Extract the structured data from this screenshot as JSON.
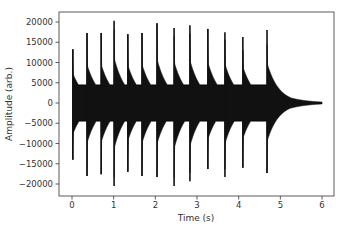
{
  "chart_data": {
    "type": "line",
    "title": "",
    "xlabel": "Time (s)",
    "ylabel": "Amplitude (arb.)",
    "xlim": [
      -0.32,
      6.3
    ],
    "ylim": [
      -22500,
      22500
    ],
    "grid": false,
    "legend": null,
    "x_ticks": [
      0,
      1,
      2,
      3,
      4,
      5,
      6
    ],
    "x_tick_labels": [
      "0",
      "1",
      "2",
      "3",
      "4",
      "5",
      "6"
    ],
    "y_ticks": [
      20000,
      15000,
      10000,
      5000,
      0,
      -5000,
      -10000,
      -15000,
      -20000
    ],
    "y_tick_labels": [
      "20000",
      "15000",
      "10000",
      "5000",
      "0",
      "−5000",
      "−10000",
      "−15000",
      "−20000"
    ],
    "line_color": "#111111",
    "strikes": [
      {
        "t": 0.02,
        "peak_pos": 13300,
        "peak_neg": -14000
      },
      {
        "t": 0.36,
        "peak_pos": 17300,
        "peak_neg": -18000
      },
      {
        "t": 0.7,
        "peak_pos": 17300,
        "peak_neg": -17600
      },
      {
        "t": 1.01,
        "peak_pos": 20300,
        "peak_neg": -20500
      },
      {
        "t": 1.34,
        "peak_pos": 17000,
        "peak_neg": -17000
      },
      {
        "t": 1.68,
        "peak_pos": 17300,
        "peak_neg": -18000
      },
      {
        "t": 2.04,
        "peak_pos": 19700,
        "peak_neg": -18300
      },
      {
        "t": 2.45,
        "peak_pos": 18500,
        "peak_neg": -20500
      },
      {
        "t": 2.83,
        "peak_pos": 19200,
        "peak_neg": -19300
      },
      {
        "t": 3.26,
        "peak_pos": 18300,
        "peak_neg": -16300
      },
      {
        "t": 3.67,
        "peak_pos": 17500,
        "peak_neg": -18300
      },
      {
        "t": 4.1,
        "peak_pos": 16300,
        "peak_neg": -16000
      },
      {
        "t": 4.68,
        "peak_pos": 18000,
        "peak_neg": -17300
      }
    ],
    "signal_end_t": 6.0
  }
}
